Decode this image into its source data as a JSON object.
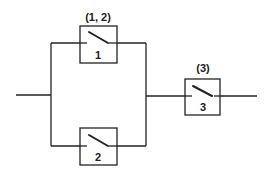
{
  "diagram": {
    "type": "reliability-block-diagram",
    "blocks": [
      {
        "id": "1",
        "label": "1",
        "group_label": "(1, 2)"
      },
      {
        "id": "2",
        "label": "2"
      },
      {
        "id": "3",
        "label": "3",
        "group_label": "(3)"
      }
    ],
    "structure": "parallel(1, 2) in series with 3"
  }
}
